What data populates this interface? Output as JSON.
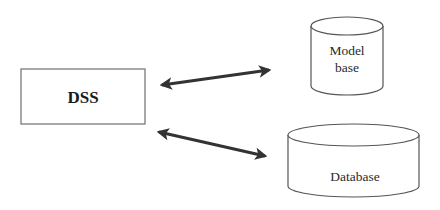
{
  "diagram": {
    "type": "block-diagram",
    "colors": {
      "background": "#ffffff",
      "outline": "#7a7a7a",
      "cylinder_outline": "#555555",
      "arrow": "#333333",
      "text": "#2a2a2a"
    },
    "nodes": {
      "dss": {
        "shape": "rectangle",
        "label": "DSS"
      },
      "model_base": {
        "shape": "cylinder",
        "label_line1": "Model",
        "label_line2": "base"
      },
      "database": {
        "shape": "cylinder",
        "label": "Database"
      }
    },
    "edges": [
      {
        "from": "DSS",
        "to": "Model base",
        "direction": "bidirectional"
      },
      {
        "from": "DSS",
        "to": "Database",
        "direction": "bidirectional"
      }
    ]
  }
}
